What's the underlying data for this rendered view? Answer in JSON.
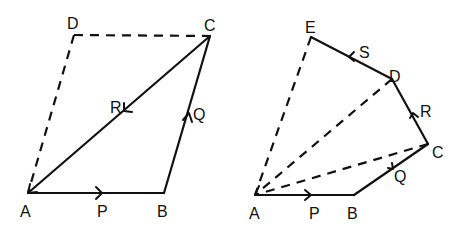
{
  "figures": [
    {
      "name": "parallelogram-of-forces",
      "points": {
        "A": "A",
        "B": "B",
        "C": "C",
        "D": "D"
      },
      "vectors": {
        "P": "P",
        "Q": "Q",
        "R": "R"
      }
    },
    {
      "name": "polygon-of-forces",
      "points": {
        "A": "A",
        "B": "B",
        "C": "C",
        "D": "D",
        "E": "E"
      },
      "vectors": {
        "P": "P",
        "Q": "Q",
        "R": "R",
        "S": "S"
      }
    }
  ],
  "colors": {
    "ink": "#111111",
    "background": "#ffffff"
  }
}
